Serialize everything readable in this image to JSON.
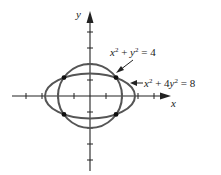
{
  "diagram": {
    "type": "graph-of-conic-intersections",
    "axes": {
      "x_label": "x",
      "y_label": "y",
      "tick_spacing_units": 1,
      "x_ticks_visible": [
        -4,
        -3,
        -2,
        -1,
        1,
        2,
        3,
        4
      ],
      "y_ticks_visible": [
        -4,
        -3,
        -2,
        -1,
        1,
        2,
        3,
        4
      ]
    },
    "curves": [
      {
        "id": "circle",
        "equation": {
          "lhs_a": "x",
          "exp_a": "2",
          "op": " + ",
          "lhs_b": "y",
          "exp_b": "2",
          "rhs": " = 4"
        },
        "label_text": "x² + y² = 4",
        "radius": 2
      },
      {
        "id": "ellipse",
        "equation": {
          "lhs_a": "x",
          "exp_a": "2",
          "op": " + 4",
          "lhs_b": "y",
          "exp_b": "2",
          "rhs": " = 8"
        },
        "label_text": "x² + 4y² = 8",
        "semi_axis_x": 2.83,
        "semi_axis_y": 1.41
      }
    ],
    "intersection_points": [
      {
        "x": 1.63,
        "y": 1.15
      },
      {
        "x": -1.63,
        "y": 1.15
      },
      {
        "x": -1.63,
        "y": -1.15
      },
      {
        "x": 1.63,
        "y": -1.15
      }
    ],
    "colors": {
      "curve": "#555555",
      "axis": "#222222",
      "point": "#111111"
    }
  }
}
